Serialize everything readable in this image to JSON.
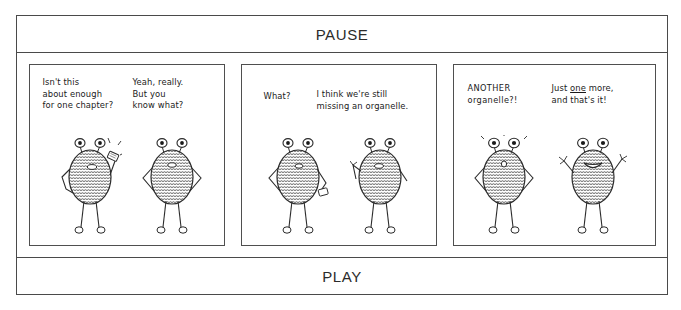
{
  "viewer": {
    "pause_label": "PAUSE",
    "play_label": "PLAY"
  },
  "comic": {
    "panels": [
      {
        "name": "panel-1",
        "dialogue_left": "Isn't this\nabout enough\nfor one chapter?",
        "dialogue_right": "Yeah, really.\nBut you\n  know what?"
      },
      {
        "name": "panel-2",
        "dialogue_left": "What?",
        "dialogue_right": "I think we're still\nmissing an organelle."
      },
      {
        "name": "panel-3",
        "dialogue_left": "ANOTHER\norganelle?!",
        "dialogue_right_pre": "Just ",
        "dialogue_right_underline": "one",
        "dialogue_right_post": " more,\nand that's it!"
      }
    ]
  },
  "colors": {
    "frame_border": "#4a4a4a",
    "panel_border": "#4f4f4f",
    "ink": "#1a1a1a",
    "background": "#ffffff"
  }
}
